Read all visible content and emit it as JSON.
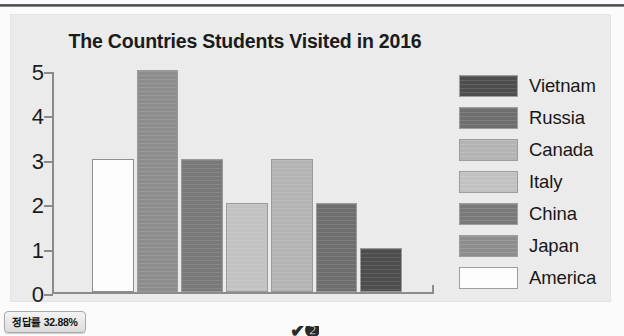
{
  "chart_data": {
    "type": "bar",
    "title": "The Countries Students Visited in 2016",
    "xlabel": "",
    "ylabel": "",
    "ylim": [
      0,
      5
    ],
    "ytick_labels": [
      "5",
      "4",
      "3",
      "2",
      "1",
      "0"
    ],
    "ytick_values": [
      5,
      4,
      3,
      2,
      1,
      0
    ],
    "grid": false,
    "legend_position": "right",
    "categories": [
      "America",
      "Japan",
      "China",
      "Italy",
      "Canada",
      "Russia",
      "Vietnam"
    ],
    "values": [
      3,
      5,
      3,
      2,
      3,
      2,
      1
    ],
    "bar_colors": [
      "#fdfdfd",
      "#8d8d8d",
      "#797979",
      "#c2c2c2",
      "#b4b4b4",
      "#6e6e6e",
      "#4d4d4d"
    ],
    "legend": [
      {
        "label": "Vietnam",
        "color": "#4d4d4d",
        "value": 1
      },
      {
        "label": "Russia",
        "color": "#6e6e6e",
        "value": 2
      },
      {
        "label": "Canada",
        "color": "#b4b4b4",
        "value": 3
      },
      {
        "label": "Italy",
        "color": "#c2c2c2",
        "value": 2
      },
      {
        "label": "China",
        "color": "#797979",
        "value": 3
      },
      {
        "label": "Japan",
        "color": "#8d8d8d",
        "value": 5
      },
      {
        "label": "America",
        "color": "#fdfdfd",
        "value": 3
      }
    ]
  },
  "footer": {
    "rate_badge": "정답률 32.88%",
    "bottom_glyph": "✔❷"
  },
  "ghost": {
    "line1": "rate of the students who visited the countries",
    "line2": "survey was conducted in the second semester",
    "line3": "and the results are shown in the graph below",
    "line4": "the number of students who visited"
  },
  "colors": {
    "panel_background": "#ebebeb",
    "axis": "#8b8b8b",
    "text": "#1b1b1b"
  }
}
